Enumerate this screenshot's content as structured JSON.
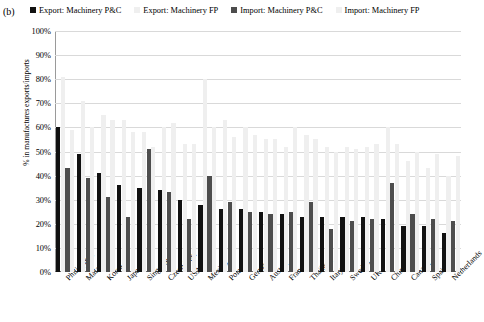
{
  "panel": {
    "label": "(b)"
  },
  "legend": {
    "items": [
      {
        "label": "Export: Machinery P&C",
        "color": "#111111"
      },
      {
        "label": "Export: Machinery FP",
        "color": "#efefef"
      },
      {
        "label": "Import:  Machinery P&C",
        "color": "#4d4d4d"
      },
      {
        "label": "Import: Machinery FP",
        "color": "#efefef"
      }
    ]
  },
  "chart_data": {
    "type": "bar",
    "title": "",
    "xlabel": "",
    "ylabel": "% in manufactures exports/imports",
    "ylim": [
      0,
      100
    ],
    "ytick_labels": [
      "100%",
      "90%",
      "80%",
      "70%",
      "60%",
      "50%",
      "40%",
      "30%",
      "20%",
      "10%",
      "0%"
    ],
    "ytick_values": [
      100,
      90,
      80,
      70,
      60,
      50,
      40,
      30,
      20,
      10,
      0
    ],
    "grid": true,
    "legend_position": "top",
    "categories": [
      "Philippines",
      "Malaysia",
      "Korea",
      "Japan",
      "Singapore",
      "Czech Rep.",
      "USA",
      "Mexico",
      "Poland",
      "Germany",
      "Austria",
      "France",
      "Thailand",
      "Italy",
      "Sweden",
      "UK",
      "China",
      "Canada",
      "Spain",
      "Netherlands"
    ],
    "series": [
      {
        "name": "Export: Machinery P&C",
        "color": "#111111",
        "values": [
          60,
          49,
          41,
          36,
          35,
          34,
          30,
          28,
          26,
          26,
          25,
          24,
          23,
          23,
          23,
          23,
          22,
          19,
          19,
          16
        ]
      },
      {
        "name": "Export: Machinery FP",
        "color": "#efefef",
        "values": [
          81,
          71,
          65,
          63,
          58,
          60,
          53,
          80,
          63,
          60,
          55,
          52,
          57,
          52,
          52,
          52,
          60,
          46,
          43,
          40
        ]
      },
      {
        "name": "Import:  Machinery P&C",
        "color": "#4d4d4d",
        "values": [
          43,
          39,
          31,
          23,
          51,
          33,
          22,
          40,
          29,
          25,
          24,
          25,
          29,
          18,
          21,
          22,
          37,
          24,
          22,
          21
        ]
      },
      {
        "name": "Import: Machinery FP",
        "color": "#efefef",
        "values": [
          59,
          60,
          63,
          58,
          52,
          62,
          53,
          60,
          56,
          57,
          55,
          60,
          55,
          50,
          51,
          53,
          53,
          50,
          49,
          48
        ]
      }
    ]
  }
}
